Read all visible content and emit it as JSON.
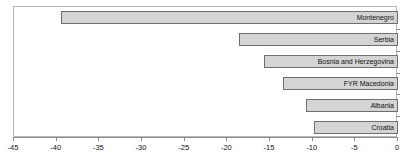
{
  "chart_data": {
    "type": "bar",
    "orientation": "horizontal",
    "title": "",
    "xlabel": "",
    "ylabel": "",
    "xlim": [
      -45,
      0
    ],
    "grid": false,
    "legend": false,
    "categories": [
      "Montenegro",
      "Serbia",
      "Bosnia and Herzegovina",
      "FYR Macedonia",
      "Albania",
      "Croatia"
    ],
    "values": [
      -39.5,
      -18.6,
      -15.7,
      -13.5,
      -10.8,
      -9.8
    ],
    "xticks": [
      -45,
      -40,
      -35,
      -30,
      -25,
      -20,
      -15,
      -10,
      -5,
      0
    ],
    "xtick_labels": [
      "-45",
      "-40",
      "-35",
      "-30",
      "-25",
      "-20",
      "-15",
      "-10",
      "-5",
      "0"
    ],
    "bar_fill_color": "#d4d4d4",
    "bar_border_color": "#6f6f6f",
    "frame_color": "#b9b9b9",
    "axis_color": "#8c8c8c",
    "label_color": "#111111"
  }
}
